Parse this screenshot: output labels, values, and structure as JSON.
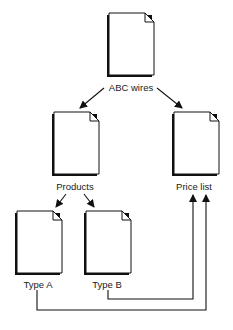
{
  "nodes": [
    {
      "id": "abc",
      "label": "ABC wires",
      "x": 107,
      "y": 13,
      "w": 45,
      "h": 62,
      "cx": 129,
      "ly": 80
    },
    {
      "id": "products",
      "label": "Products",
      "x": 52,
      "y": 112,
      "w": 45,
      "h": 62,
      "cx": 74,
      "ly": 181
    },
    {
      "id": "price",
      "label": "Price list",
      "x": 172,
      "y": 112,
      "w": 45,
      "h": 62,
      "cx": 193,
      "ly": 181
    },
    {
      "id": "typeA",
      "label": "Type A",
      "x": 16,
      "y": 211,
      "w": 45,
      "h": 62,
      "cx": 37,
      "ly": 279
    },
    {
      "id": "typeB",
      "label": "Type B",
      "x": 86,
      "y": 211,
      "w": 45,
      "h": 62,
      "cx": 107,
      "ly": 279
    }
  ],
  "edges": [
    {
      "from": "ABC wires",
      "to": "Products"
    },
    {
      "from": "ABC wires",
      "to": "Price list"
    },
    {
      "from": "Products",
      "to": "Type A"
    },
    {
      "from": "Products",
      "to": "Type B"
    },
    {
      "from": "Type B",
      "to": "Price list"
    },
    {
      "from": "Type A",
      "to": "Price list"
    }
  ],
  "colors": {
    "line": "#111111",
    "page": "#ffffff",
    "shadow": "#111111"
  }
}
